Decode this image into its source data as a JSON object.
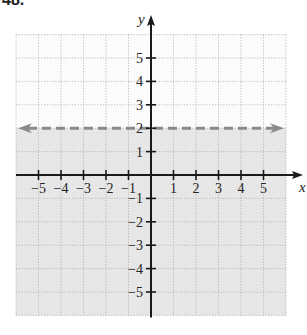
{
  "problem": {
    "label": "48."
  },
  "chart_data": {
    "type": "line",
    "title": "",
    "xlabel": "x",
    "ylabel": "y",
    "xlim": [
      -6,
      6
    ],
    "ylim": [
      -6,
      6
    ],
    "grid": true,
    "x_ticks": [
      -5,
      -4,
      -3,
      -2,
      -1,
      1,
      2,
      3,
      4,
      5
    ],
    "x_tick_labels": [
      "−5",
      "−4",
      "−3",
      "−2",
      "−1",
      "1",
      "2",
      "3",
      "4",
      "5"
    ],
    "y_ticks": [
      5,
      4,
      3,
      2,
      1,
      -1,
      -2,
      -3,
      -4,
      -5
    ],
    "y_tick_labels": [
      "5",
      "4",
      "3",
      "2",
      "1",
      "−1",
      "−2",
      "−3",
      "−4",
      "−5"
    ],
    "series": [
      {
        "name": "boundary y = 2",
        "style": "dashed",
        "arrows": "both",
        "x": [
          -6,
          6
        ],
        "y": [
          2,
          2
        ],
        "color": "#8a8a8a"
      }
    ],
    "shaded_region": {
      "description": "y < 2",
      "from_y": -6,
      "to_y": 2,
      "color": "#e6e6e6"
    }
  },
  "colors": {
    "axis": "#1a1a1a",
    "grid": "#b5b5b5",
    "shade": "#e6e6e6",
    "boundary": "#8a8a8a",
    "text": "#222222"
  }
}
